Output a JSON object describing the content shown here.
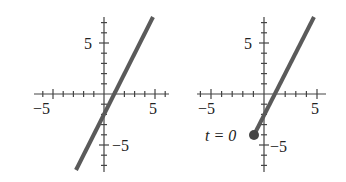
{
  "chart_data": [
    {
      "type": "line",
      "title": "",
      "xlabel": "",
      "ylabel": "",
      "xlim": [
        -7,
        6.2
      ],
      "ylim": [
        -7.5,
        7.5
      ],
      "grid": false,
      "x_tick_labels": [
        "-5",
        "5"
      ],
      "y_tick_labels": [
        "5",
        "-5"
      ],
      "series": [
        {
          "name": "line",
          "equation": "y = 2x - 2",
          "x": [
            -2.75,
            4.75
          ],
          "y": [
            -7.5,
            7.5
          ]
        }
      ],
      "color": "#555555"
    },
    {
      "type": "line",
      "title": "",
      "xlabel": "",
      "ylabel": "",
      "xlim": [
        -7,
        6.2
      ],
      "ylim": [
        -7.5,
        7.5
      ],
      "grid": false,
      "x_tick_labels": [
        "-5",
        "5"
      ],
      "y_tick_labels": [
        "5",
        "-5"
      ],
      "series": [
        {
          "name": "ray",
          "equation": "y = 2x - 2, x >= -1",
          "x": [
            -1,
            4.75
          ],
          "y": [
            -4,
            7.5
          ]
        }
      ],
      "annotations": [
        {
          "text": "t = 0",
          "x": -1,
          "y": -4,
          "marker": "filled-circle"
        }
      ],
      "color": "#555555"
    }
  ],
  "labels": {
    "left": {
      "xneg": "−5",
      "xpos": "5",
      "ypos": "5",
      "yneg": "−5"
    },
    "right": {
      "xneg": "−5",
      "xpos": "5",
      "ypos": "5",
      "yneg": "−5",
      "t0": "t = 0"
    }
  }
}
